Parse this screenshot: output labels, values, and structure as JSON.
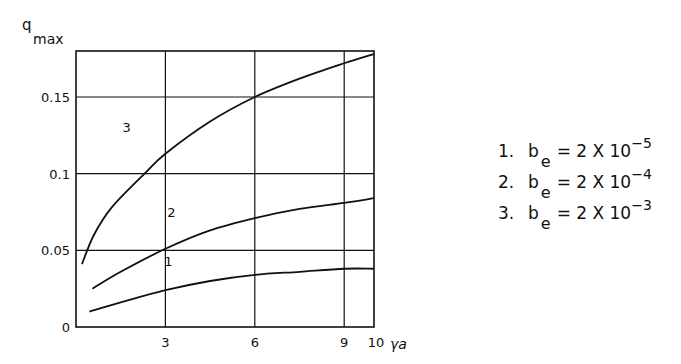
{
  "chart_data": {
    "type": "line",
    "title": "",
    "ylabel": "q_max",
    "ylabel_main": "q",
    "ylabel_sub": "max",
    "xlabel": "γa",
    "xlim": [
      0,
      10
    ],
    "ylim": [
      0,
      0.18
    ],
    "grid": true,
    "x_ticks": [
      3,
      6,
      9,
      10
    ],
    "x_tick_labels": [
      "3",
      "6",
      "9",
      "10"
    ],
    "y_ticks": [
      0,
      0.05,
      0.1,
      0.15
    ],
    "y_tick_labels": [
      "0",
      "0.05",
      "0.1",
      "0.15"
    ],
    "legend_position": "right",
    "series": [
      {
        "name": "1. b_e = 2 X 10^-5",
        "label": "1",
        "x": [
          0.45,
          1.5,
          3,
          4.5,
          6,
          7.5,
          9,
          10
        ],
        "y": [
          0.01,
          0.016,
          0.024,
          0.03,
          0.034,
          0.036,
          0.038,
          0.038
        ]
      },
      {
        "name": "2. b_e = 2 X 10^-4",
        "label": "2",
        "x": [
          0.55,
          1.5,
          3,
          4.5,
          6,
          7.5,
          9,
          10
        ],
        "y": [
          0.025,
          0.036,
          0.051,
          0.063,
          0.071,
          0.077,
          0.081,
          0.084
        ]
      },
      {
        "name": "3. b_e = 2 X 10^-3",
        "label": "3",
        "x": [
          0.2,
          0.6,
          1.2,
          2.3,
          3,
          4.5,
          6,
          7.5,
          9,
          10
        ],
        "y": [
          0.041,
          0.06,
          0.078,
          0.1,
          0.113,
          0.134,
          0.15,
          0.162,
          0.172,
          0.178
        ]
      }
    ]
  },
  "legend": [
    {
      "num": "1.",
      "symbol": "b",
      "sub": "e",
      "rel": "= 2 X 10",
      "exp": "−5"
    },
    {
      "num": "2.",
      "symbol": "b",
      "sub": "e",
      "rel": "= 2 X 10",
      "exp": "−4"
    },
    {
      "num": "3.",
      "symbol": "b",
      "sub": "e",
      "rel": "= 2 X 10",
      "exp": "−3"
    }
  ]
}
